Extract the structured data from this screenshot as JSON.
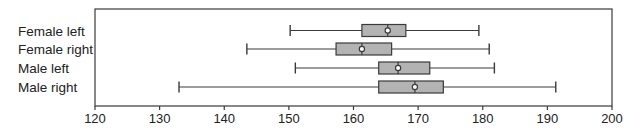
{
  "chart_data": {
    "type": "boxplot",
    "orientation": "horizontal",
    "title": "",
    "xlabel": "",
    "ylabel": "",
    "xlim": [
      120,
      200
    ],
    "x_ticks": [
      120,
      130,
      140,
      150,
      160,
      170,
      180,
      190,
      200
    ],
    "grid": false,
    "legend": null,
    "categories": [
      "Female left",
      "Female right",
      "Male left",
      "Male right"
    ],
    "series": [
      {
        "name": "Female left",
        "whisker_low": 150.2,
        "q1": 161.3,
        "median": 165.3,
        "q3": 168.1,
        "whisker_high": 179.4
      },
      {
        "name": "Female right",
        "whisker_low": 143.5,
        "q1": 157.3,
        "median": 161.3,
        "q3": 165.9,
        "whisker_high": 181.0
      },
      {
        "name": "Male left",
        "whisker_low": 151.0,
        "q1": 163.9,
        "median": 166.9,
        "q3": 171.8,
        "whisker_high": 181.8
      },
      {
        "name": "Male right",
        "whisker_low": 133.0,
        "q1": 163.9,
        "median": 169.5,
        "q3": 173.9,
        "whisker_high": 191.3
      }
    ],
    "colors": {
      "box_fill": "#b3b3b3",
      "line": "#3a3a3a",
      "median_marker": "#ffffff"
    }
  }
}
